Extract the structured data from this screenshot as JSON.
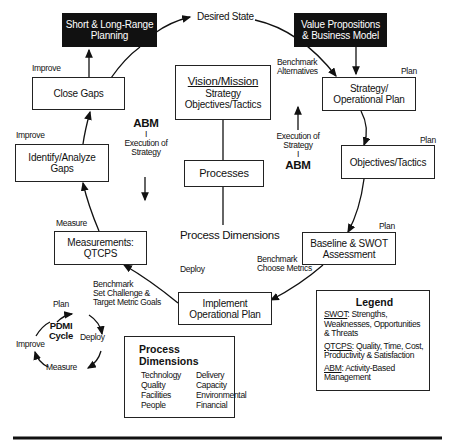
{
  "top": {
    "desired_state": "Desired State"
  },
  "nodes": {
    "short_long_range": [
      "Short & Long-Range",
      "Planning"
    ],
    "value_propositions": [
      "Value Propositions",
      "& Business Model"
    ],
    "close_gaps": "Close Gaps",
    "identify_gaps": [
      "Identify/Analyze",
      "Gaps"
    ],
    "measurements": [
      "Measurements:",
      "QTCPS"
    ],
    "implement": [
      "Implement",
      "Operational Plan"
    ],
    "baseline": [
      "Baseline & SWOT",
      "Assessment"
    ],
    "objectives": "Objectives/Tactics",
    "strategy": [
      "Strategy/",
      "Operational Plan"
    ],
    "vision": {
      "title": "Vision/Mission",
      "line1": "Strategy",
      "line2": "Objectives/Tactics"
    },
    "processes": "Processes",
    "process_dimensions_label": "Process Dimensions"
  },
  "edge_labels": {
    "improve1": "Improve",
    "improve2": "Improve",
    "measure": "Measure",
    "deploy": "Deploy",
    "plan1": "Plan",
    "plan2": "Plan",
    "plan3": "Plan",
    "benchmark_alt": [
      "Benchmark",
      "Alternatives"
    ],
    "benchmark_choose": [
      "Benchmark",
      "Choose Metrics"
    ],
    "benchmark_set": [
      "Benchmark",
      "Set Challenge &",
      "Target Metric Goals"
    ],
    "abm_left": {
      "title": "ABM",
      "bar": "I",
      "l1": "Execution of",
      "l2": "Strategy"
    },
    "abm_right": {
      "title": "ABM",
      "bar": "I",
      "l1": "Execution of",
      "l2": "Strategy"
    }
  },
  "pdmi": {
    "title1": "PDMI",
    "title2": "Cycle",
    "plan": "Plan",
    "deploy": "Deploy",
    "measure": "Measure",
    "improve": "Improve"
  },
  "process_dimensions_box": {
    "title": "Process Dimensions",
    "col1": [
      "Technology",
      "Quality",
      "Facilities",
      "People"
    ],
    "col2": [
      "Delivery",
      "Capacity",
      "Environmental",
      "Financial"
    ]
  },
  "legend": {
    "title": "Legend",
    "items": [
      {
        "abbr": "SWOT",
        "text": ":  Strengths, Weaknesses, Opportunities & Threats"
      },
      {
        "abbr": "QTCPS",
        "text": ": Quality, Time, Cost, Productivity & Satisfaction"
      },
      {
        "abbr": "ABM",
        "text": ": Activity-Based Management"
      }
    ]
  }
}
